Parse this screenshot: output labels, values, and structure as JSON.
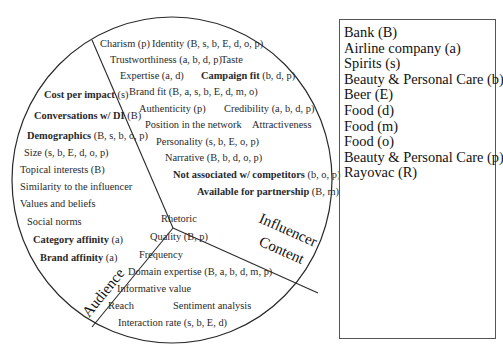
{
  "sections": {
    "influencer": "Influencer",
    "content": "Content",
    "audience": "Audience"
  },
  "influencer_factors": [
    {
      "name": "Charism",
      "codes": "(p)",
      "bold": false
    },
    {
      "name": "Identity",
      "codes": "(B, s, b, E, d, o, p)",
      "bold": false
    },
    {
      "name": "Trustworthiness",
      "codes": "(a, b, d, p)",
      "bold": false
    },
    {
      "name": "Taste",
      "codes": "",
      "bold": false
    },
    {
      "name": "Expertise",
      "codes": "(a, d)",
      "bold": false
    },
    {
      "name": "Campaign fit",
      "codes": "(b, d, p)",
      "bold": true
    },
    {
      "name": "Brand fit",
      "codes": "(B, a, s, b, E, d, m, o)",
      "bold": false
    },
    {
      "name": "Authenticity",
      "codes": "(p)",
      "bold": false
    },
    {
      "name": "Credibility",
      "codes": "(a, b, d, p)",
      "bold": false
    },
    {
      "name": "Position in the network",
      "codes": "",
      "bold": false
    },
    {
      "name": "Attractiveness",
      "codes": "",
      "bold": false
    },
    {
      "name": "Personality",
      "codes": "(s, b, E, o, p)",
      "bold": false
    },
    {
      "name": "Narrative",
      "codes": "(B, b, d, o, p)",
      "bold": false
    },
    {
      "name": "Not associated w/ competitors",
      "codes": "(b, o, p)",
      "bold": true
    },
    {
      "name": "Available for partnership",
      "codes": "(B, m)",
      "bold": true
    }
  ],
  "audience_factors": [
    {
      "name": "Cost per impact",
      "codes": "(s)",
      "bold": true
    },
    {
      "name": "Conversations w/ DI",
      "codes": "(B)",
      "bold": true
    },
    {
      "name": "Demographics",
      "codes": "(B, s, b, o, p)",
      "bold": true
    },
    {
      "name": "Size",
      "codes": "(s, b, E, d, o, p)",
      "bold": false
    },
    {
      "name": "Topical interests",
      "codes": "(B)",
      "bold": false
    },
    {
      "name": "Similarity to the influencer",
      "codes": "",
      "bold": false
    },
    {
      "name": "Values and beliefs",
      "codes": "",
      "bold": false
    },
    {
      "name": "Social norms",
      "codes": "",
      "bold": false
    },
    {
      "name": "Category affinity",
      "codes": "(a)",
      "bold": true
    },
    {
      "name": "Brand affinity",
      "codes": "(a)",
      "bold": true
    }
  ],
  "content_factors": [
    {
      "name": "Rhetoric",
      "codes": "",
      "bold": false
    },
    {
      "name": "Quality",
      "codes": "(B, p)",
      "bold": false
    },
    {
      "name": "Frequency",
      "codes": "",
      "bold": false
    },
    {
      "name": "Domain expertise",
      "codes": "(B, a, b, d, m, p)",
      "bold": false
    },
    {
      "name": "Informative value",
      "codes": "",
      "bold": false
    },
    {
      "name": "Reach",
      "codes": "",
      "bold": false
    },
    {
      "name": "Sentiment analysis",
      "codes": "",
      "bold": false
    },
    {
      "name": "Interaction rate",
      "codes": "(s, b, E, d)",
      "bold": false
    }
  ],
  "legend": {
    "items": [
      "Bank (B)",
      "Airline company (a)",
      "Spirits (s)",
      "Beauty & Personal Care (b)",
      "Beer (E)",
      "Food  (d)",
      "Food (m)",
      "Food (o)",
      "Beauty & Personal Care (p)",
      "Rayovac (R)"
    ]
  },
  "colors": {
    "line": "#2a2a2a",
    "text": "#2a2a2a",
    "background": "#ffffff"
  }
}
